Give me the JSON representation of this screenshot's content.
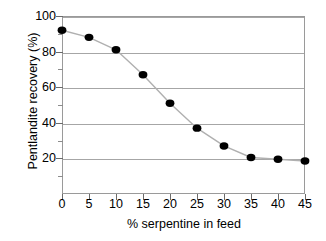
{
  "chart_data": {
    "type": "line",
    "title": "",
    "xlabel": "% serpentine in feed",
    "ylabel": "Pentlandite recovery (%)",
    "x": [
      0,
      5,
      10,
      15,
      20,
      25,
      30,
      35,
      40,
      45
    ],
    "values": [
      92,
      88,
      81,
      67,
      51,
      37,
      27,
      20.5,
      19.5,
      18.5
    ],
    "series": [
      {
        "name": "Pentlandite recovery",
        "values": [
          92,
          88,
          81,
          67,
          51,
          37,
          27,
          20.5,
          19.5,
          18.5
        ]
      }
    ],
    "xlim": [
      0,
      45
    ],
    "ylim": [
      0,
      100
    ],
    "xticks": [
      "0",
      "5",
      "10",
      "15",
      "20",
      "25",
      "30",
      "35",
      "40",
      "45"
    ],
    "yticks": [
      "20",
      "40",
      "60",
      "80",
      "100"
    ],
    "ytick_values": [
      20,
      40,
      60,
      80,
      100
    ],
    "yminor_values": [
      10,
      30,
      50,
      70,
      90
    ],
    "grid": "horizontal",
    "legend": "none",
    "marker": "filled-circle",
    "marker_color": "#000000",
    "line_color": "#b0b0b0",
    "grid_color": "#a6a6a6",
    "axis_color": "#9a9a9a",
    "background": "#ffffff"
  },
  "axes": {
    "x_title": "% serpentine in feed",
    "y_title": "Pentlandite recovery (%)"
  }
}
